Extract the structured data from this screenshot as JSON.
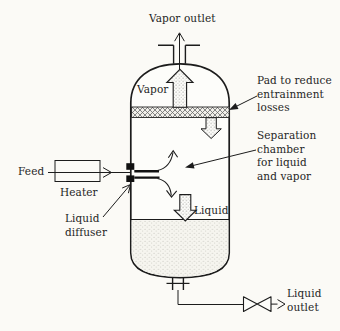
{
  "colors": {
    "line": "#1c1c1c",
    "text": "#1f1f1f",
    "background": "#fbfaf6",
    "vessel": "#fdfdfa",
    "pad_hatch": "#6a6a6a",
    "liquid_dot": "#c2c1b8"
  },
  "labels": {
    "vapor_outlet": "Vapor outlet",
    "vapor": "Vapor",
    "pad": [
      "Pad to reduce",
      "entrainment",
      "losses"
    ],
    "separation_chamber": [
      "Separation",
      "chamber",
      "for liquid",
      "and vapor"
    ],
    "feed": "Feed",
    "heater": "Heater",
    "liquid_diffuser": [
      "Liquid",
      "diffuser"
    ],
    "liquid": "Liquid",
    "liquid_outlet": [
      "Liquid",
      "outlet"
    ]
  }
}
